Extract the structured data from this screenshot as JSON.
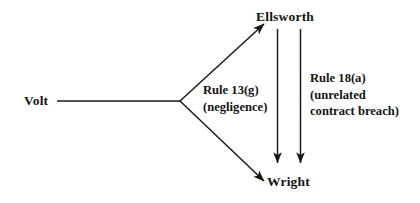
{
  "diagram": {
    "type": "litigation-joinder-claim-diagram",
    "background_color": "#ffffff",
    "line_color": "#161616",
    "text_color": "#141414",
    "nodes": [
      {
        "id": "volt",
        "label": "Volt"
      },
      {
        "id": "ellsworth",
        "label": "Ellsworth"
      },
      {
        "id": "wright",
        "label": "Wright"
      }
    ],
    "edge_labels": {
      "rule13": {
        "line1": "Rule 13(g)",
        "line2": "(negligence)"
      },
      "rule18": {
        "line1": "Rule 18(a)",
        "line2": "(unrelated",
        "line3": "contract breach)"
      }
    },
    "edges": [
      {
        "from": "volt",
        "to": "ellsworth",
        "arrow": true,
        "style": "solid"
      },
      {
        "from": "volt",
        "to": "wright",
        "arrow": true,
        "style": "solid"
      },
      {
        "from": "ellsworth",
        "to": "wright",
        "arrow": true,
        "style": "solid",
        "label": "rule13"
      },
      {
        "from": "ellsworth",
        "to": "wright",
        "arrow": true,
        "style": "solid",
        "label": "rule18"
      }
    ]
  }
}
